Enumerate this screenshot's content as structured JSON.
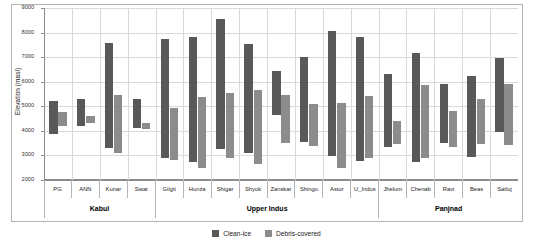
{
  "chart_data": {
    "type": "bar",
    "title": "",
    "subtitle": "",
    "xlabel": "",
    "ylabel": "Elevation (masl)",
    "ylim": [
      2000,
      9000
    ],
    "yticks": [
      2000,
      3000,
      4000,
      5000,
      6000,
      7000,
      8000,
      9000
    ],
    "grid": true,
    "legend_position": "bottom",
    "note": "Floating (range) bars: each bar spans from a minimum to a maximum elevation.",
    "categories": [
      "PG",
      "ANN",
      "Kunar",
      "Swat",
      "Gilgit",
      "Hunza",
      "Shigar",
      "Shyok",
      "Zanskar",
      "Shingo",
      "Astor",
      "U_Indus",
      "Jhelum",
      "Chenab",
      "Ravi",
      "Beas",
      "Satluj"
    ],
    "groups": [
      {
        "label": "Kabul",
        "categories": [
          "PG",
          "ANN",
          "Kunar",
          "Swat"
        ]
      },
      {
        "label": "Upper Indus",
        "categories": [
          "Gilgit",
          "Hunza",
          "Shigar",
          "Shyok",
          "Zanskar",
          "Shingo",
          "Astor",
          "U_Indus"
        ]
      },
      {
        "label": "Panjnad",
        "categories": [
          "Jhelum",
          "Chenab",
          "Ravi",
          "Beas",
          "Satluj"
        ]
      }
    ],
    "series": [
      {
        "name": "Clean-ice",
        "color": "#595959",
        "ranges": [
          {
            "category": "PG",
            "min": 3870,
            "max": 5230
          },
          {
            "category": "ANN",
            "min": 4180,
            "max": 5280
          },
          {
            "category": "Kunar",
            "min": 3300,
            "max": 7580
          },
          {
            "category": "Swat",
            "min": 4130,
            "max": 5290
          },
          {
            "category": "Gilgit",
            "min": 2900,
            "max": 7750
          },
          {
            "category": "Hunza",
            "min": 2740,
            "max": 7800
          },
          {
            "category": "Shigar",
            "min": 3260,
            "max": 8540
          },
          {
            "category": "Shyok",
            "min": 3090,
            "max": 7520
          },
          {
            "category": "Zanskar",
            "min": 4640,
            "max": 6420
          },
          {
            "category": "Shingo",
            "min": 3560,
            "max": 6990
          },
          {
            "category": "Astor",
            "min": 2960,
            "max": 8080
          },
          {
            "category": "U_Indus",
            "min": 2760,
            "max": 7840
          },
          {
            "category": "Jhelum",
            "min": 3330,
            "max": 6300
          },
          {
            "category": "Chenab",
            "min": 2740,
            "max": 7150
          },
          {
            "category": "Ravi",
            "min": 3500,
            "max": 5890
          },
          {
            "category": "Beas",
            "min": 2930,
            "max": 6250
          },
          {
            "category": "Satluj",
            "min": 3970,
            "max": 6980
          }
        ]
      },
      {
        "name": "Debris-covered",
        "color": "#8c8c8c",
        "ranges": [
          {
            "category": "PG",
            "min": 4200,
            "max": 4780
          },
          {
            "category": "ANN",
            "min": 4310,
            "max": 4620
          },
          {
            "category": "Swat",
            "min": 4060,
            "max": 4310
          },
          {
            "category": "Kunar",
            "min": 3080,
            "max": 5450
          },
          {
            "category": "Gilgit",
            "min": 2830,
            "max": 4940
          },
          {
            "category": "Hunza",
            "min": 2480,
            "max": 5360
          },
          {
            "category": "Shigar",
            "min": 2900,
            "max": 5560
          },
          {
            "category": "Shyok",
            "min": 2660,
            "max": 5680
          },
          {
            "category": "Zanskar",
            "min": 3490,
            "max": 5460
          },
          {
            "category": "Shingo",
            "min": 3390,
            "max": 5090
          },
          {
            "category": "Astor",
            "min": 2490,
            "max": 5140
          },
          {
            "category": "U_Indus",
            "min": 2890,
            "max": 5400
          },
          {
            "category": "Jhelum",
            "min": 3460,
            "max": 4390
          },
          {
            "category": "Chenab",
            "min": 2880,
            "max": 5880
          },
          {
            "category": "Ravi",
            "min": 3350,
            "max": 4790
          },
          {
            "category": "Beas",
            "min": 3470,
            "max": 5300
          },
          {
            "category": "Satluj",
            "min": 3420,
            "max": 5900
          }
        ]
      }
    ],
    "legend": [
      "Clean-ice",
      "Debris-covered"
    ]
  },
  "axis": {
    "ylabel": "Elevation (masl)",
    "ytick_labels": [
      "9000",
      "8000",
      "7000",
      "6000",
      "5000",
      "4000",
      "3000",
      "2000"
    ]
  },
  "legend": {
    "items": [
      {
        "label": "Clean-ice",
        "color": "#595959",
        "swatch": "clean-ice-swatch"
      },
      {
        "label": "Debris-covered",
        "color": "#8c8c8c",
        "swatch": "debris-covered-swatch"
      }
    ]
  }
}
